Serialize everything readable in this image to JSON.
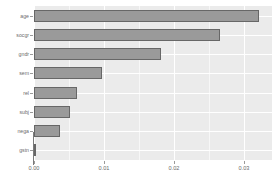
{
  "chart_data": {
    "type": "bar",
    "orientation": "horizontal",
    "title": "",
    "subtitle": "",
    "xlabel": "",
    "ylabel": "",
    "categories": [
      "age",
      "socgr",
      "gndr",
      "sem",
      "rel",
      "subj",
      "nega",
      "gstn"
    ],
    "values": [
      0.0321,
      0.0266,
      0.0181,
      0.0097,
      0.0062,
      0.0052,
      0.0037,
      0.0002
    ],
    "xlim": [
      0.0,
      0.034
    ],
    "ylim": [
      0,
      8
    ],
    "x_ticks": [
      0.0,
      0.01,
      0.02,
      0.03
    ],
    "x_tick_labels": [
      "0.00",
      "0.01",
      "0.02",
      "0.03"
    ],
    "y_tick_labels": [
      "age",
      "socgr",
      "gndr",
      "sem",
      "rel",
      "subj",
      "nega",
      "gstn"
    ],
    "grid": true,
    "grid_color": "#ffffff",
    "minor_grid": true,
    "legend": false,
    "legend_position": "none",
    "bar_fill": "#9a9a9a",
    "bar_border": "#676767",
    "panel_background": "#ebebeb",
    "plot_background": "#ffffff",
    "tick_label_color": "#6b6b6b"
  },
  "axis": {
    "x_ticks": [
      {
        "label": "0.00",
        "value": 0.0
      },
      {
        "label": "0.01",
        "value": 0.01
      },
      {
        "label": "0.02",
        "value": 0.02
      },
      {
        "label": "0.03",
        "value": 0.03
      }
    ],
    "y_ticks": [
      {
        "label": "age"
      },
      {
        "label": "socgr"
      },
      {
        "label": "gndr"
      },
      {
        "label": "sem"
      },
      {
        "label": "rel"
      },
      {
        "label": "subj"
      },
      {
        "label": "nega"
      },
      {
        "label": "gstn"
      }
    ]
  }
}
